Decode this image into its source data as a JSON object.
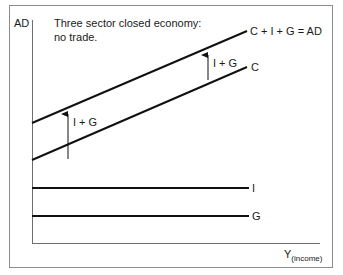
{
  "figure": {
    "annotation_line1": "Three sector closed economy:",
    "annotation_line2": "no trade.",
    "colors": {
      "frame": "#8c8c8c",
      "axis": "#6e6e6e",
      "line": "#111111",
      "text": "#1a1a1a",
      "background": "#ffffff"
    }
  },
  "axes": {
    "y_label": "AD",
    "x_label": "Y",
    "x_label_subscript": "(income)"
  },
  "lines": [
    {
      "id": "ad",
      "label": "C + I + G = AD",
      "type": "sloped"
    },
    {
      "id": "c",
      "label": "C",
      "type": "sloped"
    },
    {
      "id": "i",
      "label": "I",
      "type": "horizontal"
    },
    {
      "id": "g",
      "label": "G",
      "type": "horizontal"
    }
  ],
  "arrows": [
    {
      "id": "shift-left",
      "label": "I + G"
    },
    {
      "id": "shift-right",
      "label": "I + G"
    }
  ]
}
